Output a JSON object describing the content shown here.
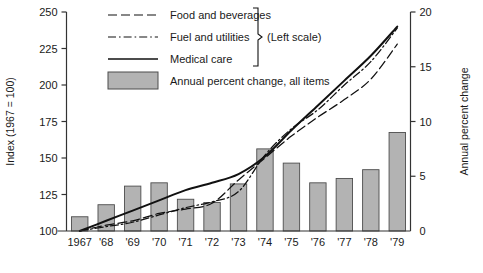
{
  "chart_data": {
    "type": "bar",
    "title": "",
    "categories": [
      "1967",
      "'68",
      "'69",
      "'70",
      "'71",
      "'72",
      "'73",
      "'74",
      "'75",
      "'76",
      "'77",
      "'78",
      "'79"
    ],
    "xlabel": "",
    "left_axis": {
      "label": "Index (1967 = 100)",
      "ylim": [
        100,
        250
      ],
      "ticks": [
        100,
        125,
        150,
        175,
        200,
        225,
        250
      ],
      "tick_labels": [
        "100",
        "125",
        "150",
        "175",
        "200",
        "225",
        "250"
      ]
    },
    "right_axis": {
      "label": "Annual percent change",
      "ylim": [
        0,
        20
      ],
      "ticks": [
        0,
        5,
        10,
        15,
        20
      ],
      "tick_labels": [
        "0",
        "5",
        "10",
        "15",
        "20"
      ]
    },
    "grid": false,
    "legend_position": "top-center",
    "bars": {
      "name": "Annual percent change, all items",
      "axis": "right",
      "color": "#b3b3b3",
      "edge_color": "#4d4d4d",
      "values": [
        1.3,
        2.4,
        4.1,
        4.4,
        2.9,
        2.6,
        4.3,
        7.5,
        6.2,
        4.4,
        4.8,
        5.6,
        9.0
      ]
    },
    "series": [
      {
        "name": "Food and beverages",
        "axis": "left",
        "style": "dashed",
        "values": [
          100,
          104,
          107,
          112,
          115,
          119,
          135,
          150,
          165,
          178,
          190,
          204,
          228
        ]
      },
      {
        "name": "Fuel and utilities",
        "axis": "left",
        "style": "dash-dot",
        "values": [
          100,
          103,
          106,
          111,
          116,
          120,
          127,
          152,
          170,
          183,
          200,
          216,
          239
        ]
      },
      {
        "name": "Medical care",
        "axis": "left",
        "style": "solid",
        "values": [
          100,
          107,
          114,
          121,
          128,
          133,
          139,
          151,
          169,
          186,
          203,
          220,
          240
        ]
      }
    ],
    "annotations": [
      {
        "text": "(Left scale)",
        "target": "brace over first three legend entries"
      }
    ]
  },
  "legend": {
    "items": [
      {
        "label": "Food and beverages",
        "swatch": "dashed-line-swatch"
      },
      {
        "label": "Fuel and utilities",
        "swatch": "dash-dot-line-swatch"
      },
      {
        "label": "Medical care",
        "swatch": "solid-line-swatch"
      },
      {
        "label": "Annual percent change, all items",
        "swatch": "filled-rect-swatch"
      }
    ],
    "brace_note": "(Left scale)"
  },
  "colors": {
    "bar_fill": "#b3b3b3",
    "bar_edge": "#4d4d4d",
    "line": "#111111",
    "axis": "#333333",
    "text": "#1a1a1a"
  }
}
